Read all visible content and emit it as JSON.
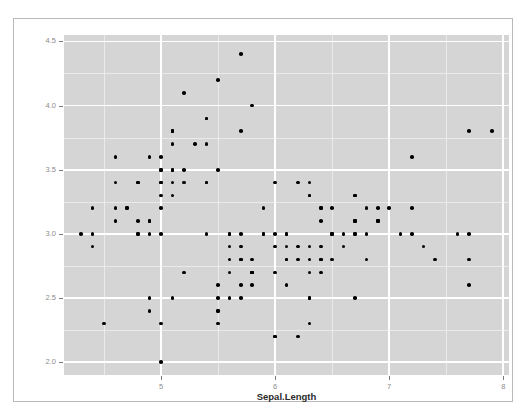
{
  "top_clipped_text": "",
  "figure": {
    "title": "",
    "background_color": "#ffffff",
    "panel_color": "#d5d5d5",
    "grid_major_color": "#ffffff",
    "grid_minor_color": "#eaeaea",
    "point_color": "#000000",
    "frame_color": "#b9b9b9",
    "tick_label_color": "#8c8c8c",
    "axis_title_color": "#2b2b2b"
  },
  "chart_data": {
    "type": "scatter",
    "title": "",
    "xlabel": "Sepal.Length",
    "ylabel": "Sepal.Width",
    "xlim": [
      4.15,
      8.05
    ],
    "ylim": [
      1.9,
      4.55
    ],
    "xticks": [
      5,
      6,
      7,
      8
    ],
    "xtick_labels": [
      "5",
      "6",
      "7",
      "8"
    ],
    "yticks": [
      2.0,
      2.5,
      3.0,
      3.5,
      4.0,
      4.5
    ],
    "ytick_labels": [
      "2.0",
      "2.5",
      "3.0",
      "3.5",
      "4.0",
      "4.5"
    ],
    "x_minor_ticks": [
      4.5,
      5.5,
      6.5,
      7.5
    ],
    "y_minor_ticks": [
      2.25,
      2.75,
      3.25,
      3.75,
      4.25
    ],
    "grid": true,
    "legend": false,
    "legend_position": "none",
    "n_points": 150,
    "marker": "filled-circle",
    "marker_size_px": 3.6,
    "series": [
      {
        "name": "iris",
        "x": [
          5.1,
          4.9,
          4.7,
          4.6,
          5.0,
          5.4,
          4.6,
          5.0,
          4.4,
          4.9,
          5.4,
          4.8,
          4.8,
          4.3,
          5.8,
          5.7,
          5.4,
          5.1,
          5.7,
          5.1,
          5.4,
          5.1,
          4.6,
          5.1,
          4.8,
          5.0,
          5.0,
          5.2,
          5.2,
          4.7,
          4.8,
          5.4,
          5.2,
          5.5,
          4.9,
          5.0,
          5.5,
          4.9,
          4.4,
          5.1,
          5.0,
          4.5,
          4.4,
          5.0,
          5.1,
          4.8,
          5.1,
          4.6,
          5.3,
          5.0,
          7.0,
          6.4,
          6.9,
          5.5,
          6.5,
          5.7,
          6.3,
          4.9,
          6.6,
          5.2,
          5.0,
          5.9,
          6.0,
          6.1,
          5.6,
          6.7,
          5.6,
          5.8,
          6.2,
          5.6,
          5.9,
          6.1,
          6.3,
          6.1,
          6.4,
          6.6,
          6.8,
          6.7,
          6.0,
          5.7,
          5.5,
          5.5,
          5.8,
          6.0,
          5.4,
          6.0,
          6.7,
          6.3,
          5.6,
          5.5,
          5.5,
          6.1,
          5.8,
          5.0,
          5.6,
          5.7,
          5.7,
          6.2,
          5.1,
          5.7,
          6.3,
          5.8,
          7.1,
          6.3,
          6.5,
          7.6,
          4.9,
          7.3,
          6.7,
          7.2,
          6.5,
          6.4,
          6.8,
          5.7,
          5.8,
          6.4,
          6.5,
          7.7,
          7.7,
          6.0,
          6.9,
          5.6,
          7.7,
          6.3,
          6.7,
          7.2,
          6.2,
          6.1,
          6.4,
          7.2,
          7.4,
          7.9,
          6.4,
          6.3,
          6.1,
          7.7,
          6.3,
          6.4,
          6.0,
          6.9,
          6.7,
          6.9,
          5.8,
          6.8,
          6.7,
          6.7,
          6.3,
          6.5,
          6.2,
          5.9
        ],
        "y": [
          3.5,
          3.0,
          3.2,
          3.1,
          3.6,
          3.9,
          3.4,
          3.4,
          2.9,
          3.1,
          3.7,
          3.4,
          3.0,
          3.0,
          4.0,
          4.4,
          3.9,
          3.5,
          3.8,
          3.8,
          3.4,
          3.7,
          3.6,
          3.3,
          3.4,
          3.0,
          3.4,
          3.5,
          3.4,
          3.2,
          3.1,
          3.4,
          4.1,
          4.2,
          3.1,
          3.2,
          3.5,
          3.6,
          3.0,
          3.4,
          3.5,
          2.3,
          3.2,
          3.5,
          3.8,
          3.0,
          3.8,
          3.2,
          3.7,
          3.3,
          3.2,
          3.2,
          3.1,
          2.3,
          2.8,
          2.8,
          3.3,
          2.4,
          2.9,
          2.7,
          2.0,
          3.0,
          2.2,
          2.9,
          2.9,
          3.1,
          3.0,
          2.7,
          2.2,
          2.5,
          3.2,
          2.8,
          2.5,
          2.8,
          2.9,
          3.0,
          2.8,
          3.0,
          2.9,
          2.6,
          2.4,
          2.4,
          2.7,
          2.7,
          3.0,
          3.4,
          3.1,
          2.3,
          3.0,
          2.5,
          2.6,
          3.0,
          2.6,
          2.3,
          2.7,
          3.0,
          2.9,
          2.9,
          2.5,
          2.8,
          3.3,
          2.7,
          3.0,
          2.9,
          3.0,
          3.0,
          2.5,
          2.9,
          2.5,
          3.6,
          3.2,
          2.7,
          3.0,
          2.5,
          2.8,
          3.2,
          3.0,
          3.8,
          2.6,
          2.2,
          3.2,
          2.8,
          2.8,
          2.7,
          3.3,
          3.2,
          2.8,
          3.0,
          2.8,
          3.0,
          2.8,
          3.8,
          2.8,
          2.8,
          2.6,
          3.0,
          3.4,
          3.1,
          3.0,
          3.1,
          3.1,
          3.1,
          2.7,
          3.2,
          3.3,
          3.0,
          2.5,
          3.0,
          3.4,
          3.0
        ]
      }
    ]
  }
}
